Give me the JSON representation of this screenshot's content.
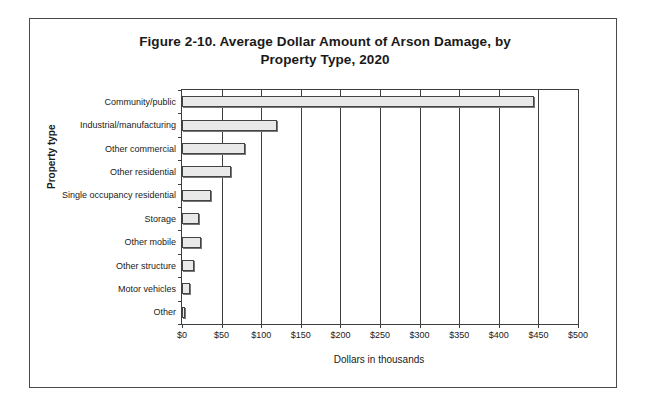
{
  "figure": {
    "title_line1": "Figure 2-10. Average Dollar Amount of Arson Damage, by",
    "title_line2": "Property Type, 2020"
  },
  "chart_data": {
    "type": "bar",
    "orientation": "horizontal",
    "title": "Figure 2-10. Average Dollar Amount of Arson Damage, by Property Type, 2020",
    "xlabel": "Dollars in thousands",
    "ylabel": "Property type",
    "categories": [
      "Community/public",
      "Industrial/manufacturing",
      "Other commercial",
      "Other residential",
      "Single occupancy residential",
      "Storage",
      "Other mobile",
      "Other structure",
      "Motor vehicles",
      "Other"
    ],
    "values": [
      445,
      120,
      80,
      62,
      37,
      21,
      24,
      15,
      10,
      4
    ],
    "xlim": [
      0,
      500
    ],
    "xticks": [
      0,
      50,
      100,
      150,
      200,
      250,
      300,
      350,
      400,
      450,
      500
    ],
    "xticklabels": [
      "$0",
      "$50",
      "$100",
      "$150",
      "$200",
      "$250",
      "$300",
      "$350",
      "$400",
      "$450",
      "$500"
    ],
    "grid": "vertical",
    "legend": "none",
    "bar_fill": "#e9e9e9",
    "bar_border": "#444444"
  }
}
